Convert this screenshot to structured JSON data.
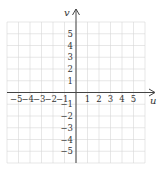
{
  "diagram": {
    "type": "coordinate-plane",
    "horizontal_axis": {
      "label": "u",
      "min": -6,
      "max": 6
    },
    "vertical_axis": {
      "label": "v",
      "min": -6,
      "max": 6
    },
    "x_tick_labels": [
      "−5",
      "−4",
      "−3",
      "−2",
      "−1",
      "1",
      "2",
      "3",
      "4",
      "5"
    ],
    "x_tick_values": [
      -5,
      -4,
      -3,
      -2,
      -1,
      1,
      2,
      3,
      4,
      5
    ],
    "y_tick_labels": [
      "5",
      "4",
      "3",
      "2",
      "1",
      "−1",
      "−2",
      "−3",
      "−4",
      "−5"
    ],
    "y_tick_values": [
      5,
      4,
      3,
      2,
      1,
      -1,
      -2,
      -3,
      -4,
      -5
    ],
    "grid": true,
    "colors": {
      "grid": "#d6d6d6",
      "axis": "#444444",
      "text": "#333333"
    }
  }
}
